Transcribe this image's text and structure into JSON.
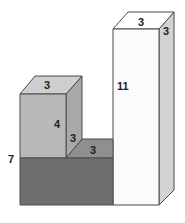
{
  "diagram": {
    "type": "3d-block-figure",
    "colors": {
      "small_cube_front": "#b9b9b9",
      "small_cube_top": "#cfcfcf",
      "small_cube_side": "#a8a8a8",
      "base_front": "#6e6e6e",
      "step_top": "#8f8f8f",
      "tall_front": "#fbfbfb",
      "tall_top": "#ffffff",
      "tall_side": "#d2d2d2",
      "stroke": "#4a4a4a"
    },
    "labels": {
      "small_cube_top_width": "3",
      "small_cube_height": "4",
      "small_cube_side_depth": "3",
      "step_top_depth": "3",
      "left_total_height": "7",
      "tall_height": "11",
      "tall_top_width": "3",
      "tall_side_depth": "3"
    }
  }
}
